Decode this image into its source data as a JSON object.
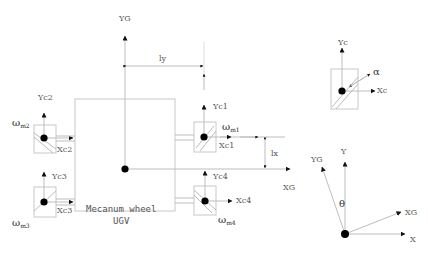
{
  "diagram": {
    "colors": {
      "line": "#bdbdbd",
      "body_outline": "#c8c8c8",
      "arrow": "#111111",
      "dot": "#000000",
      "label": "#555555"
    },
    "body": {
      "label_line1": "Mecanum wheel",
      "label_line2": "UGV"
    },
    "global_axes": {
      "y_label": "YG",
      "x_label": "XG"
    },
    "dimensions": {
      "ly": "ly",
      "lx": "lx"
    },
    "wheels": [
      {
        "id": 1,
        "y_label": "Yc1",
        "x_label": "Xc1",
        "omega": "ω",
        "omega_sub": "m1"
      },
      {
        "id": 2,
        "y_label": "Yc2",
        "x_label": "Xc2",
        "omega": "ω",
        "omega_sub": "m2"
      },
      {
        "id": 3,
        "y_label": "Yc3",
        "x_label": "Xc3",
        "omega": "ω",
        "omega_sub": "m3"
      },
      {
        "id": 4,
        "y_label": "Yc4",
        "x_label": "Xc4",
        "omega": "ω",
        "omega_sub": "m4"
      }
    ],
    "wheel_frame_detail": {
      "y_label": "Yc",
      "x_label": "Xc",
      "angle_label": "α"
    },
    "rotation_frame": {
      "y_label": "Y",
      "x_label": "X",
      "yg_label": "YG",
      "xg_label": "XG",
      "angle_label": "θ"
    }
  }
}
